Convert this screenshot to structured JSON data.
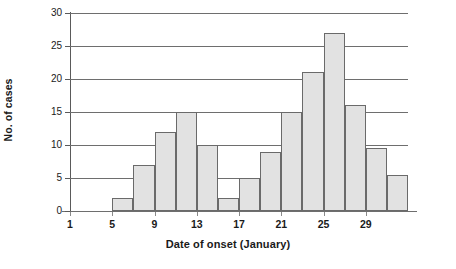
{
  "chart_data": {
    "type": "bar",
    "title": "",
    "xlabel": "Date of onset (January)",
    "ylabel": "No. of cases",
    "grid": true,
    "legend": "none",
    "xlim": [
      1,
      33
    ],
    "ylim": [
      0,
      30
    ],
    "bin_width": 2,
    "x_tick_labels": [
      "1",
      "5",
      "9",
      "13",
      "17",
      "21",
      "25",
      "29"
    ],
    "x_tick_values": [
      1,
      5,
      9,
      13,
      17,
      21,
      25,
      29
    ],
    "y_tick_labels": [
      "0",
      "5",
      "10",
      "15",
      "20",
      "25",
      "30"
    ],
    "y_tick_values": [
      0,
      5,
      10,
      15,
      20,
      25,
      30
    ],
    "categories": [
      "5-6",
      "7-8",
      "9-10",
      "11-12",
      "13-14",
      "15-16",
      "17-18",
      "19-20",
      "21-22",
      "23-24",
      "25-26",
      "27-28",
      "29-30",
      "31-32"
    ],
    "bin_starts": [
      5,
      7,
      9,
      11,
      13,
      15,
      17,
      19,
      21,
      23,
      25,
      27,
      29,
      31
    ],
    "values": [
      2,
      7,
      12,
      15,
      10,
      2,
      5,
      9,
      15,
      21,
      27,
      16,
      9.5,
      5.5
    ],
    "bar_fill_color": "#e2e2e2",
    "bar_border_color": "#6a6a6a",
    "gridline_color": "#6e6e6e",
    "axis_color": "#5a5a5a",
    "text_color": "#1a1a1a",
    "background_color": "#ffffff"
  }
}
